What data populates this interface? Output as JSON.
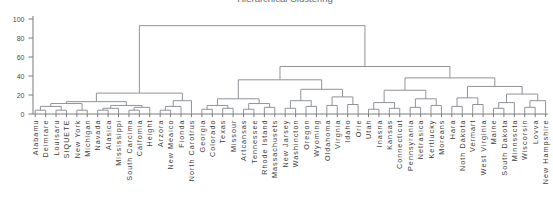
{
  "chart_data": {
    "type": "dendrogram",
    "title": "Hierarchical Clustering",
    "xlabel": "",
    "ylabel": "",
    "ylim": [
      0,
      100
    ],
    "yticks": [
      0,
      20,
      40,
      60,
      80,
      100
    ],
    "grid": false,
    "legend": null,
    "colors": {
      "line": "#8f9399",
      "axis": "#7a7a7a",
      "tick": "#7a7a7a",
      "label": "#3c3c3c",
      "title": "#6a6a6a",
      "background": "#ffffff"
    },
    "leaves": [
      "Alabamu",
      "Deimrare",
      "Louisaru",
      "SIQUETE",
      "New York",
      "Michigan",
      "Navada",
      "Alasica",
      "Mississippi",
      "South Carcima",
      "Calfomia",
      "Height",
      "Arzora",
      "New Meaico",
      "Fionda",
      "North Carotrus",
      "Georgia",
      "Colorado",
      "Texas",
      "Missour",
      "Artcansas",
      "Tennessee",
      "Rhode Istand",
      "Massachusets",
      "New Jarsey",
      "Washincton",
      "Oregon",
      "Wyoming",
      "Oldahoma",
      "Virgnia",
      "Idaho",
      "Orie",
      "Utah",
      "Inasna",
      "Kansas",
      "Connecticut",
      "Pennsyrania",
      "Netrasica",
      "Kertlucky",
      "Moreans",
      "Hara",
      "Noth Dakota",
      "Vermart",
      "West Virginia",
      "Maine",
      "South Dakota",
      "Minnsscta",
      "Wiscorsin",
      "Lovva",
      "New Hampshire"
    ],
    "linkage": {
      "h": 93,
      "c": [
        {
          "h": 22,
          "c": [
            {
              "h": 13,
              "c": [
                {
                  "h": 11,
                  "c": [
                    {
                      "h": 8,
                      "c": [
                        {
                          "h": 4,
                          "c": [
                            0,
                            1
                          ]
                        },
                        {
                          "h": 4,
                          "c": [
                            2,
                            3
                          ]
                        }
                      ]
                    },
                    {
                      "h": 4,
                      "c": [
                        4,
                        5
                      ]
                    }
                  ]
                },
                {
                  "h": 9,
                  "c": [
                    {
                      "h": 6,
                      "c": [
                        {
                          "h": 4,
                          "c": [
                            6,
                            7
                          ]
                        },
                        8
                      ]
                    },
                    {
                      "h": 7,
                      "c": [
                        {
                          "h": 4,
                          "c": [
                            9,
                            10
                          ]
                        },
                        11
                      ]
                    }
                  ]
                }
              ]
            },
            {
              "h": 14,
              "c": [
                {
                  "h": 8,
                  "c": [
                    {
                      "h": 4,
                      "c": [
                        12,
                        13
                      ]
                    },
                    14
                  ]
                },
                15
              ]
            }
          ]
        },
        {
          "h": 50,
          "c": [
            {
              "h": 36,
              "c": [
                {
                  "h": 16,
                  "c": [
                    {
                      "h": 9,
                      "c": [
                        {
                          "h": 5,
                          "c": [
                            16,
                            17
                          ]
                        },
                        {
                          "h": 6,
                          "c": [
                            18,
                            19
                          ]
                        }
                      ]
                    },
                    {
                      "h": 11,
                      "c": [
                        {
                          "h": 5,
                          "c": [
                            20,
                            21
                          ]
                        },
                        {
                          "h": 7,
                          "c": [
                            22,
                            23
                          ]
                        }
                      ]
                    }
                  ]
                },
                {
                  "h": 26,
                  "c": [
                    {
                      "h": 14,
                      "c": [
                        {
                          "h": 6,
                          "c": [
                            24,
                            25
                          ]
                        },
                        {
                          "h": 8,
                          "c": [
                            26,
                            27
                          ]
                        }
                      ]
                    },
                    {
                      "h": 18,
                      "c": [
                        {
                          "h": 9,
                          "c": [
                            28,
                            29
                          ]
                        },
                        {
                          "h": 10,
                          "c": [
                            30,
                            31
                          ]
                        }
                      ]
                    }
                  ]
                }
              ]
            },
            {
              "h": 38,
              "c": [
                {
                  "h": 25,
                  "c": [
                    {
                      "h": 12,
                      "c": [
                        {
                          "h": 5,
                          "c": [
                            32,
                            33
                          ]
                        },
                        {
                          "h": 6,
                          "c": [
                            34,
                            35
                          ]
                        }
                      ]
                    },
                    {
                      "h": 16,
                      "c": [
                        {
                          "h": 7,
                          "c": [
                            36,
                            37
                          ]
                        },
                        {
                          "h": 9,
                          "c": [
                            38,
                            39
                          ]
                        }
                      ]
                    }
                  ]
                },
                {
                  "h": 29,
                  "c": [
                    {
                      "h": 17,
                      "c": [
                        {
                          "h": 8,
                          "c": [
                            40,
                            41
                          ]
                        },
                        {
                          "h": 10,
                          "c": [
                            42,
                            43
                          ]
                        }
                      ]
                    },
                    {
                      "h": 21,
                      "c": [
                        {
                          "h": 12,
                          "c": [
                            {
                              "h": 6,
                              "c": [
                                44,
                                45
                              ]
                            },
                            46
                          ]
                        },
                        {
                          "h": 14,
                          "c": [
                            {
                              "h": 7,
                              "c": [
                                47,
                                48
                              ]
                            },
                            49
                          ]
                        }
                      ]
                    }
                  ]
                }
              ]
            }
          ]
        }
      ]
    }
  }
}
